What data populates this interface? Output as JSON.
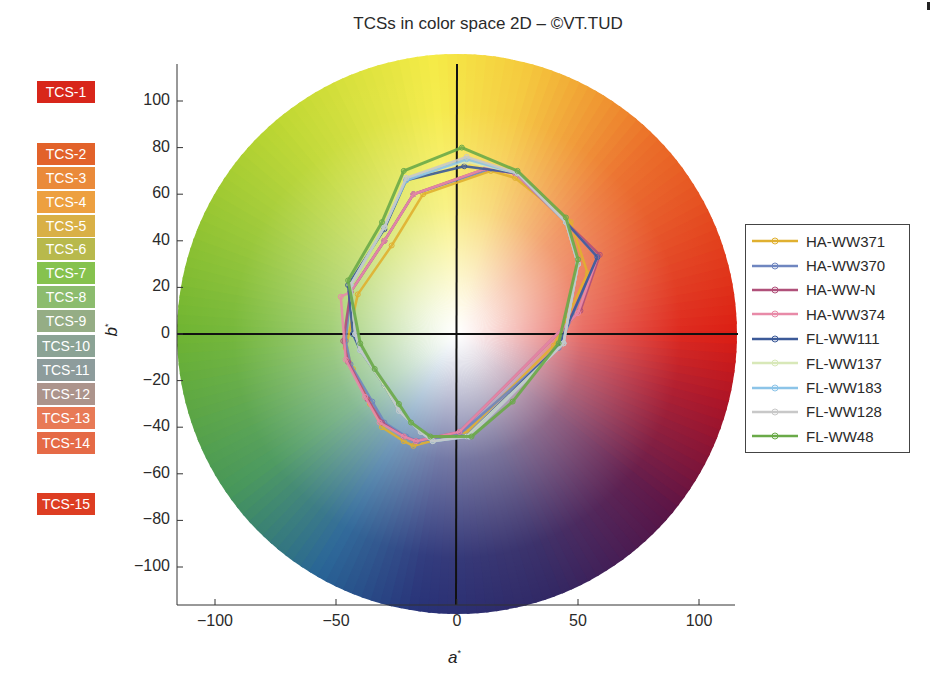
{
  "title": "TCSs in color space 2D – ©VT.TUD",
  "tcs_labels": [
    {
      "label": "TCS-1",
      "color": "#d8261a",
      "top": 81
    },
    {
      "label": "TCS-2",
      "color": "#e2622a",
      "top": 143
    },
    {
      "label": "TCS-3",
      "color": "#ea8a3a",
      "top": 167
    },
    {
      "label": "TCS-4",
      "color": "#eda040",
      "top": 191
    },
    {
      "label": "TCS-5",
      "color": "#d9b046",
      "top": 215
    },
    {
      "label": "TCS-6",
      "color": "#b8b94c",
      "top": 238
    },
    {
      "label": "TCS-7",
      "color": "#86c24e",
      "top": 262
    },
    {
      "label": "TCS-8",
      "color": "#8cbc6e",
      "top": 286
    },
    {
      "label": "TCS-9",
      "color": "#95ad85",
      "top": 310
    },
    {
      "label": "TCS-10",
      "color": "#8ba395",
      "top": 335
    },
    {
      "label": "TCS-11",
      "color": "#8d9c9c",
      "top": 359
    },
    {
      "label": "TCS-12",
      "color": "#ac948c",
      "top": 383
    },
    {
      "label": "TCS-13",
      "color": "#e87a56",
      "top": 407
    },
    {
      "label": "TCS-14",
      "color": "#e56a46",
      "top": 432
    },
    {
      "label": "TCS-15",
      "color": "#dd3d22",
      "top": 493
    }
  ],
  "chart_data": {
    "type": "line",
    "title": "TCSs in color space 2D – ©VT.TUD",
    "xlabel": "a*",
    "ylabel": "b*",
    "xlim": [
      -116,
      116
    ],
    "ylim": [
      -116,
      116
    ],
    "xticks": [
      -100,
      -50,
      0,
      50,
      100
    ],
    "yticks": [
      100,
      80,
      60,
      40,
      20,
      0,
      -20,
      -40,
      -60,
      -80,
      -100
    ],
    "grid": false,
    "background": "CIELAB a*b* color wheel, radius ~116",
    "legend_position": "right",
    "point_labels": [
      "TCS-1",
      "TCS-2",
      "TCS-3",
      "TCS-4",
      "TCS-5",
      "TCS-6",
      "TCS-7",
      "TCS-8",
      "TCS-9",
      "TCS-10",
      "TCS-11",
      "TCS-12",
      "TCS-13",
      "TCS-14",
      "TCS-15"
    ],
    "series": [
      {
        "name": "HA-WW371",
        "color": "#e0b030",
        "a": [
          54,
          47,
          24,
          14,
          -14,
          -27,
          -41,
          -46,
          -43,
          -36,
          -31,
          -22,
          -18,
          4,
          40
        ],
        "b": [
          26,
          48,
          67,
          70,
          60,
          38,
          17,
          -6,
          -15,
          -30,
          -40,
          -46,
          -48,
          -42,
          -5
        ]
      },
      {
        "name": "HA-WW370",
        "color": "#6f86c0",
        "a": [
          58,
          45,
          24,
          14,
          -18,
          -30,
          -44,
          -46,
          -44,
          -35,
          -30,
          -21,
          -16,
          1,
          42
        ],
        "b": [
          33,
          48,
          69,
          71,
          60,
          40,
          18,
          -3,
          -13,
          -29,
          -38,
          -44,
          -46,
          -43,
          -6
        ]
      },
      {
        "name": "HA-WW-N",
        "color": "#b0507a",
        "a": [
          59,
          45,
          24,
          12,
          -18,
          -30,
          -44,
          -47,
          -45,
          -37,
          -31,
          -22,
          -17,
          1,
          51
        ],
        "b": [
          34,
          48,
          69,
          71,
          60,
          40,
          18,
          -3,
          -12,
          -28,
          -38,
          -44,
          -46,
          -42,
          10
        ]
      },
      {
        "name": "HA-WW374",
        "color": "#e88aa8",
        "a": [
          58,
          45,
          24,
          12,
          -18,
          -30,
          -44,
          -48,
          -46,
          -38,
          -32,
          -22,
          -17,
          1,
          50
        ],
        "b": [
          33,
          48,
          69,
          71,
          60,
          40,
          18,
          16,
          -11,
          -27,
          -38,
          -44,
          -46,
          -42,
          9
        ]
      },
      {
        "name": "FL-WW111",
        "color": "#3c5a98",
        "a": [
          58,
          45,
          25,
          3,
          -21,
          -30,
          -45,
          -43,
          -40,
          -30,
          -24,
          -15,
          -10,
          4,
          42
        ],
        "b": [
          33,
          48,
          69,
          72,
          66,
          45,
          21,
          0,
          -7,
          -22,
          -33,
          -42,
          -46,
          -44,
          -5
        ]
      },
      {
        "name": "FL-WW137",
        "color": "#d8e8b8",
        "a": [
          50,
          45,
          25,
          4,
          -21,
          -30,
          -44,
          -42,
          -40,
          -30,
          -24,
          -15,
          -10,
          4,
          44
        ],
        "b": [
          30,
          48,
          69,
          74,
          67,
          46,
          21,
          0,
          -7,
          -22,
          -33,
          -42,
          -46,
          -44,
          -4
        ]
      },
      {
        "name": "FL-WW183",
        "color": "#8cc4e8",
        "a": [
          50,
          45,
          25,
          4,
          -21,
          -30,
          -44,
          -42,
          -40,
          -29,
          -24,
          -15,
          -10,
          5,
          44
        ],
        "b": [
          30,
          48,
          69,
          75,
          66,
          46,
          21,
          0,
          -7,
          -22,
          -33,
          -42,
          -46,
          -44,
          -4
        ]
      },
      {
        "name": "FL-WW128",
        "color": "#c8c8c8",
        "a": [
          50,
          45,
          25,
          4,
          -21,
          -30,
          -44,
          -42,
          -40,
          -29,
          -24,
          -15,
          -10,
          5,
          44
        ],
        "b": [
          30,
          48,
          69,
          76,
          67,
          46,
          21,
          0,
          -7,
          -22,
          -33,
          -42,
          -46,
          -44,
          -4
        ]
      },
      {
        "name": "FL-WW48",
        "color": "#6aaa48",
        "a": [
          50,
          45,
          25,
          2,
          -22,
          -31,
          -45,
          -40,
          -34,
          -24,
          -19,
          -11,
          6,
          23,
          42
        ],
        "b": [
          32,
          50,
          70,
          80,
          70,
          48,
          23,
          -4,
          -15,
          -30,
          -38,
          -44,
          -44,
          -29,
          -4
        ]
      }
    ]
  },
  "legend": {
    "items": [
      {
        "label": "HA-WW371",
        "color": "#e0b030"
      },
      {
        "label": "HA-WW370",
        "color": "#6f86c0"
      },
      {
        "label": "HA-WW-N",
        "color": "#b0507a"
      },
      {
        "label": "HA-WW374",
        "color": "#e88aa8"
      },
      {
        "label": "FL-WW111",
        "color": "#3c5a98"
      },
      {
        "label": "FL-WW137",
        "color": "#d8e8b8"
      },
      {
        "label": "FL-WW183",
        "color": "#8cc4e8"
      },
      {
        "label": "FL-WW128",
        "color": "#c8c8c8"
      },
      {
        "label": "FL-WW48",
        "color": "#6aaa48"
      }
    ]
  },
  "axes": {
    "x_label": "a",
    "y_label": "b",
    "label_superscript": "*",
    "x_ticks": [
      "−100",
      "−50",
      "0",
      "50",
      "100"
    ],
    "y_ticks": [
      "100",
      "80",
      "60",
      "40",
      "20",
      "0",
      "−20",
      "−40",
      "−60",
      "−80",
      "−100"
    ]
  }
}
